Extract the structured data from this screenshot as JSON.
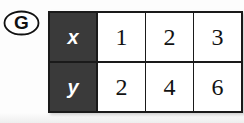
{
  "item": {
    "label": "G",
    "marker_shape": "oval"
  },
  "table": {
    "header_column": [
      "x",
      "y"
    ],
    "rows": [
      {
        "header": "x",
        "values": [
          "1",
          "2",
          "3"
        ]
      },
      {
        "header": "y",
        "values": [
          "2",
          "4",
          "6"
        ]
      }
    ],
    "colors": {
      "header_background": "#3a3a3a",
      "header_text": "#ffffff",
      "cell_background": "#ffffff",
      "cell_text": "#121212",
      "border": "#1a1a1a"
    }
  }
}
